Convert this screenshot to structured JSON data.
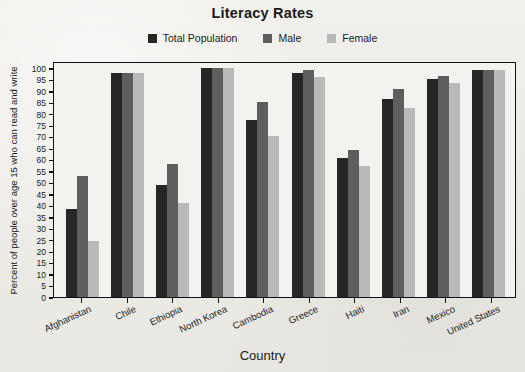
{
  "chart_data": {
    "type": "bar",
    "title": "Literacy Rates",
    "xlabel": "Country",
    "ylabel": "Percent of people over age 15 who can read and write",
    "ylim": [
      0,
      100
    ],
    "ytick_step": 5,
    "yticks": [
      100,
      95,
      90,
      85,
      80,
      75,
      70,
      65,
      60,
      55,
      50,
      45,
      40,
      35,
      30,
      25,
      20,
      15,
      10,
      5,
      0
    ],
    "grid": false,
    "legend_position": "top-center",
    "categories": [
      "Afghanistan",
      "Chile",
      "Ethiopia",
      "North Korea",
      "Cambodia",
      "Greece",
      "Haiti",
      "Iran",
      "Mexico",
      "United States"
    ],
    "series": [
      {
        "name": "Total Population",
        "color": "#262626",
        "values": [
          38.5,
          97.8,
          49.0,
          100.0,
          77.5,
          98.0,
          60.7,
          86.5,
          95.0,
          99.0
        ]
      },
      {
        "name": "Male",
        "color": "#5e5e5e",
        "values": [
          53.0,
          97.8,
          58.0,
          100.0,
          85.0,
          99.3,
          64.3,
          91.0,
          96.5,
          99.0
        ]
      },
      {
        "name": "Female",
        "color": "#b9b9b9",
        "values": [
          24.5,
          97.8,
          41.0,
          100.0,
          70.5,
          96.0,
          57.3,
          82.5,
          93.3,
          99.0
        ]
      }
    ]
  },
  "colors": {
    "background": "#f0eeea",
    "plot_background": "#f4f2ee",
    "axis": "#111111",
    "total_population": "#262626",
    "male": "#5e5e5e",
    "female": "#b9b9b9"
  }
}
